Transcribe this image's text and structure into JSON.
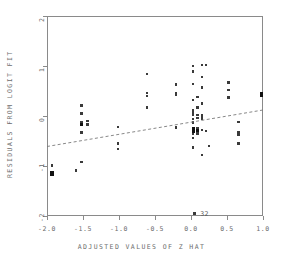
{
  "chart_data": {
    "type": "scatter",
    "title": "",
    "xlabel": "ADJUSTED VALUES OF Z HAT",
    "ylabel": "RESIDUALS FROM LOGIT FIT",
    "xlim": [
      -2.0,
      1.0
    ],
    "ylim": [
      -2.0,
      2.0
    ],
    "xticks": [
      -2.0,
      -1.5,
      -1.0,
      -0.5,
      0.0,
      0.5,
      1.0
    ],
    "xticklabels": [
      "-2.0",
      "-1.5",
      "-1.0",
      "-0.5",
      "0.0",
      "0.5",
      "1.0"
    ],
    "yticks": [
      2,
      1,
      0,
      -1,
      -2
    ],
    "yticklabels": [
      "2",
      "1",
      "0",
      "-1",
      "-2"
    ],
    "grid": false,
    "legend": null,
    "marker": "filled-square",
    "points": [
      {
        "x": -1.93,
        "y": -0.99
      },
      {
        "x": -1.93,
        "y": -1.13,
        "weight": "heavy"
      },
      {
        "x": -1.93,
        "y": -1.17,
        "weight": "heavy"
      },
      {
        "x": -1.6,
        "y": -1.09
      },
      {
        "x": -1.52,
        "y": 0.21
      },
      {
        "x": -1.52,
        "y": 0.05
      },
      {
        "x": -1.52,
        "y": -0.12
      },
      {
        "x": -1.52,
        "y": -0.17,
        "weight": "heavy"
      },
      {
        "x": -1.52,
        "y": -0.33
      },
      {
        "x": -1.52,
        "y": -0.92
      },
      {
        "x": -1.44,
        "y": -0.1
      },
      {
        "x": -1.44,
        "y": -0.17
      },
      {
        "x": -1.01,
        "y": -0.22
      },
      {
        "x": -1.01,
        "y": -0.55
      },
      {
        "x": -1.01,
        "y": -0.66
      },
      {
        "x": -0.61,
        "y": 0.84
      },
      {
        "x": -0.61,
        "y": 0.46
      },
      {
        "x": -0.61,
        "y": 0.4
      },
      {
        "x": -0.61,
        "y": 0.17
      },
      {
        "x": -0.21,
        "y": 0.63
      },
      {
        "x": -0.21,
        "y": 0.46
      },
      {
        "x": -0.21,
        "y": 0.43
      },
      {
        "x": -0.21,
        "y": -0.23
      },
      {
        "x": 0.03,
        "y": 1.0
      },
      {
        "x": 0.03,
        "y": 0.89
      },
      {
        "x": 0.03,
        "y": 0.64
      },
      {
        "x": 0.03,
        "y": 0.32
      },
      {
        "x": 0.03,
        "y": 0.12
      },
      {
        "x": 0.03,
        "y": 0.07
      },
      {
        "x": 0.03,
        "y": 0.02
      },
      {
        "x": 0.03,
        "y": -0.06
      },
      {
        "x": 0.03,
        "y": -0.13
      },
      {
        "x": 0.03,
        "y": -0.26,
        "weight": "heavy"
      },
      {
        "x": 0.03,
        "y": -0.31,
        "weight": "heavy"
      },
      {
        "x": 0.03,
        "y": -0.36
      },
      {
        "x": 0.03,
        "y": -0.44
      },
      {
        "x": 0.03,
        "y": -0.63
      },
      {
        "x": 0.09,
        "y": 0.38
      },
      {
        "x": 0.09,
        "y": 0.17
      },
      {
        "x": 0.09,
        "y": 0.02
      },
      {
        "x": 0.09,
        "y": -0.04
      },
      {
        "x": 0.09,
        "y": -0.24
      },
      {
        "x": 0.09,
        "y": -0.29,
        "weight": "heavy"
      },
      {
        "x": 0.09,
        "y": -0.35
      },
      {
        "x": 0.15,
        "y": 1.02
      },
      {
        "x": 0.15,
        "y": 0.78
      },
      {
        "x": 0.15,
        "y": 0.57
      },
      {
        "x": 0.15,
        "y": 0.25
      },
      {
        "x": 0.15,
        "y": 0.01
      },
      {
        "x": 0.15,
        "y": -0.05
      },
      {
        "x": 0.15,
        "y": -0.28
      },
      {
        "x": 0.15,
        "y": -0.78
      },
      {
        "x": 0.21,
        "y": 1.02
      },
      {
        "x": 0.21,
        "y": -0.3
      },
      {
        "x": 0.25,
        "y": -0.6
      },
      {
        "x": 0.52,
        "y": 0.67
      },
      {
        "x": 0.52,
        "y": 0.52
      },
      {
        "x": 0.52,
        "y": 0.37
      },
      {
        "x": 0.66,
        "y": -0.12
      },
      {
        "x": 0.66,
        "y": -0.33
      },
      {
        "x": 0.66,
        "y": -0.37
      },
      {
        "x": 0.66,
        "y": -0.55
      },
      {
        "x": 0.98,
        "y": 0.45,
        "weight": "heavy"
      },
      {
        "x": 0.98,
        "y": 0.41,
        "weight": "heavy"
      },
      {
        "x": 0.05,
        "y": -1.95
      }
    ],
    "trend_line": {
      "style": "dashed",
      "x0": -2.0,
      "y0": -0.61,
      "x1": 1.0,
      "y1": 0.12
    },
    "annotations": [
      {
        "text": "32",
        "x": 0.1,
        "y": -1.95
      }
    ]
  },
  "colors": {
    "axis": "#8a8a8a",
    "text": "#6d6d6d",
    "marker": "#3a3a3a",
    "marker_heavy": "#111111",
    "background": "#ffffff"
  }
}
